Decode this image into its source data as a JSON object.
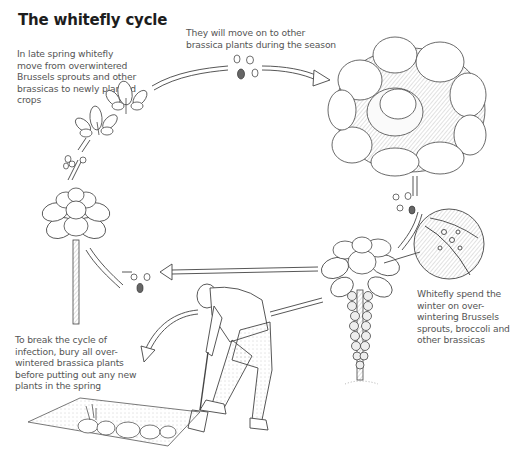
{
  "title": "The whitefly cycle",
  "captions": {
    "spring": "In late spring whitefly move from overwintered Brussels sprouts and other brassicas to newly planted crops",
    "move": "They will move on to other brassica plants during the season",
    "winter": "Whitefly spend the winter on over-wintering Brussels sprouts, broccoli and other brassicas",
    "break_cycle": "To break the cycle of infection, bury all over-wintered brassica plants before putting out any new plants in the spring"
  },
  "illustrations": [
    {
      "name": "young-seedlings",
      "description": "Two newly planted brassica seedlings"
    },
    {
      "name": "brussels-sprout-young",
      "description": "Young Brussels sprout plant on tall stem"
    },
    {
      "name": "cabbage",
      "description": "Mature cabbage head"
    },
    {
      "name": "brussels-sprout-mature",
      "description": "Mature Brussels sprout plant with sprouts on stem"
    },
    {
      "name": "leaf-magnifier",
      "description": "Magnified circular view of leaf underside with whitefly"
    },
    {
      "name": "gardener-digging",
      "description": "Gardener digging trench with spade"
    },
    {
      "name": "trench",
      "description": "Trench with buried brassica plants"
    },
    {
      "name": "whitefly-clusters",
      "description": "Small groups of whitefly insects along the cycle arrows"
    }
  ],
  "colors": {
    "ink": "#3a3a3a",
    "title": "#1d1d1d",
    "background": "#ffffff"
  }
}
